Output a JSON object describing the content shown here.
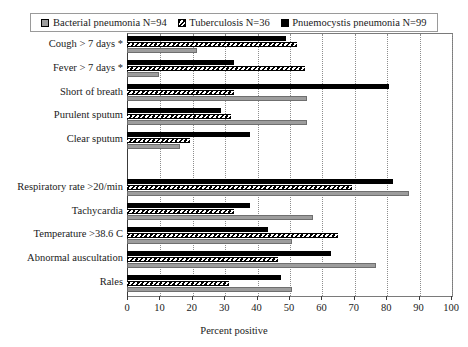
{
  "chart_data": {
    "type": "bar",
    "orientation": "horizontal",
    "title": "",
    "xlabel": "Percent positive",
    "ylabel": "",
    "xlim": [
      0,
      100
    ],
    "xticks": [
      0,
      10,
      20,
      30,
      40,
      50,
      60,
      70,
      80,
      90,
      100
    ],
    "grid": "vertical-dotted",
    "legend_position": "top",
    "categories": [
      "Cough > 7 days *",
      "Fever > 7 days *",
      "Short of breath",
      "Purulent sputum",
      "Clear sputum",
      "",
      "Respiratory rate >20/min",
      "Tachycardia",
      "Temperature >38.6 C",
      "Abnormal auscultation",
      "Rales"
    ],
    "series": [
      {
        "name": "Bacterial pneumonia N=94",
        "short_name": "Bacterial pneumonia",
        "n": 94,
        "fill": "gray",
        "color": "#9d9d9d",
        "values": [
          21.5,
          10,
          55.5,
          55.5,
          16.5,
          null,
          87,
          57.5,
          51,
          77,
          51
        ]
      },
      {
        "name": "Tuberculosis N=36",
        "short_name": "Tuberculosis",
        "n": 36,
        "fill": "hatched",
        "color": "#ffffff",
        "values": [
          52.5,
          55,
          33,
          32,
          19.5,
          null,
          69.5,
          33,
          65,
          46.5,
          31.5
        ]
      },
      {
        "name": "Pnuemocystis pneumonia N=99",
        "short_name": "Pnuemocystis pneumonia",
        "n": 99,
        "fill": "solid-black",
        "color": "#000000",
        "values": [
          49,
          33,
          81,
          29,
          38,
          null,
          82,
          38,
          43.5,
          63,
          47.5
        ]
      }
    ]
  },
  "legend": {
    "items": [
      {
        "label": "Bacterial pneumonia N=94",
        "swatch": "gray"
      },
      {
        "label": "Tuberculosis N=36",
        "swatch": "hatched"
      },
      {
        "label": "Pnuemocystis pneumonia N=99",
        "swatch": "black"
      }
    ]
  }
}
